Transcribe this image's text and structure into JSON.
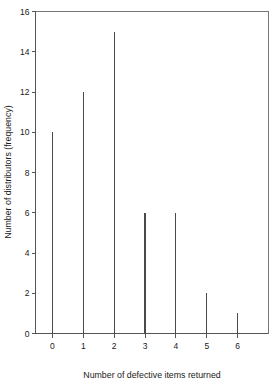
{
  "chart_data": {
    "type": "bar",
    "title": "",
    "xlabel": "Number of defective items returned",
    "ylabel": "Number of distributors (frequency)",
    "categories": [
      "0",
      "1",
      "2",
      "3",
      "4",
      "5",
      "6"
    ],
    "values": [
      10,
      12,
      15,
      6,
      6,
      2,
      1
    ],
    "x": [
      0,
      1,
      2,
      3,
      4,
      5,
      6
    ],
    "xlim": [
      -0.55,
      7.0
    ],
    "ylim": [
      0,
      16
    ],
    "yticks": [
      0,
      2,
      4,
      6,
      8,
      10,
      12,
      14,
      16
    ],
    "ytick_labels": [
      "0",
      "2",
      "4",
      "6",
      "8",
      "10",
      "12",
      "14",
      "16"
    ],
    "xticks": [
      0,
      1,
      2,
      3,
      4,
      5,
      6
    ],
    "xtick_labels": [
      "0",
      "1",
      "2",
      "3",
      "4",
      "5",
      "6"
    ],
    "grid": false,
    "legend": null,
    "style": "spike",
    "colors": {
      "spike": "#4a4a4a",
      "axis": "#555555",
      "frame": "#777777",
      "background": "#ffffff",
      "text": "#1a1a1a"
    }
  }
}
